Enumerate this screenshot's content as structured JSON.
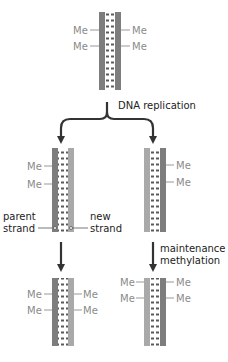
{
  "labels": {
    "methyl": "Me",
    "dna_replication": "DNA replication",
    "parent_strand_line1": "parent",
    "parent_strand_line2": "strand",
    "new_strand_line1": "new",
    "new_strand_line2": "strand",
    "maintenance_line1": "maintenance",
    "maintenance_line2": "methylation"
  },
  "colors": {
    "parent_strand": "#7d7d7d",
    "new_strand": "#a9a9a9",
    "rung": "#5a5a5a",
    "arrow": "#333333",
    "methyl_text": "#8a8a8a"
  }
}
